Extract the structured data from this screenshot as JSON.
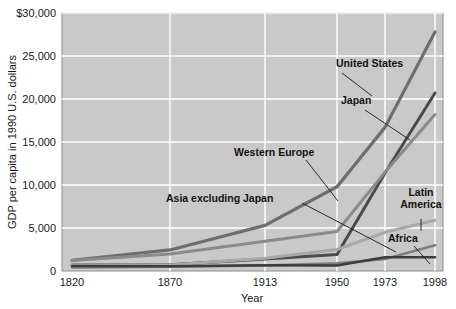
{
  "chart_data": {
    "type": "line",
    "title": "",
    "xlabel": "Year",
    "ylabel": "GDP per capita in 1990 U.S. dollars",
    "x": [
      1820,
      1870,
      1913,
      1950,
      1973,
      1998
    ],
    "xtick_labels": [
      "1820",
      "1870",
      "1913",
      "1950",
      "1973",
      "1998"
    ],
    "ytick_values": [
      0,
      5000,
      10000,
      15000,
      20000,
      25000,
      30000
    ],
    "ytick_labels": [
      "0",
      "5,000",
      "10,000",
      "15,000",
      "20,000",
      "25,000",
      "$30,000"
    ],
    "ylim": [
      0,
      30000
    ],
    "xlim": [
      1820,
      1998
    ],
    "grid": true,
    "grid_color": "#ffffff",
    "plot_bg": "#c9c9c9",
    "legend": "inline-annotations",
    "series": [
      {
        "name": "United States",
        "color": "#6e6e6e",
        "width": 3.2,
        "values": [
          1250,
          2450,
          5300,
          9800,
          16700,
          27800
        ]
      },
      {
        "name": "Japan",
        "color": "#4a4a4a",
        "width": 3.0,
        "values": [
          700,
          740,
          1390,
          1930,
          11400,
          20700
        ]
      },
      {
        "name": "Western Europe",
        "color": "#8a8a8a",
        "width": 3.0,
        "values": [
          1230,
          1970,
          3470,
          4600,
          11500,
          18200
        ]
      },
      {
        "name": "Latin America",
        "color": "#a8a8a8",
        "width": 3.0,
        "values": [
          670,
          700,
          1480,
          2500,
          4500,
          5900
        ]
      },
      {
        "name": "Africa",
        "color": "#7d7d7d",
        "width": 2.6,
        "values": [
          420,
          500,
          640,
          890,
          1400,
          3000
        ]
      },
      {
        "name": "Asia excluding Japan",
        "color": "#3d3d3d",
        "width": 2.6,
        "values": [
          580,
          550,
          660,
          640,
          1600,
          1600
        ]
      }
    ],
    "annotations": [
      {
        "label": "United States",
        "lines": [
          "United States"
        ],
        "text_x": 336,
        "text_y": 67,
        "anchor": "start",
        "leader": [
          [
            342,
            73
          ],
          [
            372,
            96
          ]
        ]
      },
      {
        "label": "Japan",
        "lines": [
          "Japan"
        ],
        "text_x": 341,
        "text_y": 104,
        "anchor": "start",
        "leader": [
          [
            365,
            110
          ],
          [
            410,
            140
          ]
        ]
      },
      {
        "label": "Western Europe",
        "lines": [
          "Western Europe"
        ],
        "text_x": 234,
        "text_y": 156,
        "anchor": "start",
        "leader": [
          [
            306,
            160
          ],
          [
            338,
            201
          ]
        ]
      },
      {
        "label": "Asia excluding Japan",
        "lines": [
          "Asia excluding Japan"
        ],
        "text_x": 166,
        "text_y": 202,
        "anchor": "start",
        "leader": [
          [
            302,
            203
          ],
          [
            396,
            252
          ]
        ]
      },
      {
        "label": "Latin America",
        "lines": [
          "Latin",
          "America"
        ],
        "text_x": 421,
        "text_y": 196,
        "anchor": "middle",
        "leader": [
          [
            421,
            219
          ],
          [
            421,
            231
          ]
        ]
      },
      {
        "label": "Africa",
        "lines": [
          "Africa"
        ],
        "text_x": 388,
        "text_y": 242,
        "anchor": "start",
        "leader": [
          [
            414,
            246
          ],
          [
            430,
            264
          ]
        ]
      }
    ]
  },
  "axis": {
    "y_title": "GDP per capita in 1990 U.S. dollars",
    "x_title": "Year"
  }
}
